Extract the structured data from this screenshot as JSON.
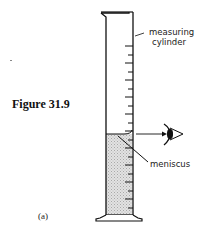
{
  "figure": {
    "caption": "Figure 31.9",
    "part_label": "(a)"
  },
  "labels": {
    "cylinder_line1": "measuring",
    "cylinder_line2": "cylinder",
    "meniscus": "meniscus"
  },
  "diagram": {
    "colors": {
      "line": "#111111",
      "liquid": "#d4d4d4",
      "background": "#ffffff"
    },
    "tick_count": 20
  }
}
